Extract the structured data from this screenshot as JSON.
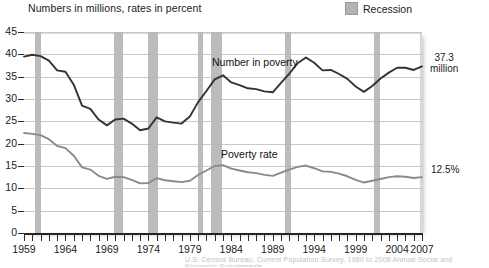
{
  "header": {
    "note": "Numbers in millions, rates in percent"
  },
  "legend": {
    "position": "top-right",
    "entries": [
      {
        "label": "Recession",
        "color": "#b6b6b6",
        "icon": "square-swatch"
      }
    ]
  },
  "annotations": {
    "number_label": "Number in poverty",
    "rate_label": "Poverty rate",
    "right_value_number_line1": "37.3",
    "right_value_number_line2": "million",
    "right_value_rate": "12.5%"
  },
  "footer": {
    "source_smudge": "U.S. Census Bureau, Current Population Survey, 1960 to 2008 Annual Social and Economic Supplements."
  },
  "chart_data": {
    "type": "line",
    "title": "",
    "subtitle": "Numbers in millions, rates in percent",
    "xlabel": "",
    "ylabel": "",
    "xlim": [
      1959,
      2007
    ],
    "ylim": [
      0,
      45
    ],
    "ytick_step": 5,
    "yticks": [
      0,
      5,
      10,
      15,
      20,
      25,
      30,
      35,
      40,
      45
    ],
    "xticks_labeled": [
      1959,
      1964,
      1969,
      1974,
      1979,
      1984,
      1989,
      1994,
      1999,
      2004,
      2007
    ],
    "xtick_step_minor": 1,
    "grid": true,
    "grid_axis": "y",
    "legend_position": "top-right",
    "x": [
      1959,
      1960,
      1961,
      1962,
      1963,
      1964,
      1965,
      1966,
      1967,
      1968,
      1969,
      1970,
      1971,
      1972,
      1973,
      1974,
      1975,
      1976,
      1977,
      1978,
      1979,
      1980,
      1981,
      1982,
      1983,
      1984,
      1985,
      1986,
      1987,
      1988,
      1989,
      1990,
      1991,
      1992,
      1993,
      1994,
      1995,
      1996,
      1997,
      1998,
      1999,
      2000,
      2001,
      2002,
      2003,
      2004,
      2005,
      2006,
      2007
    ],
    "series": [
      {
        "name": "Number in poverty",
        "units": "millions",
        "color": "#333333",
        "end_label": "37.3 million",
        "values": [
          39.5,
          39.9,
          39.6,
          38.6,
          36.4,
          36.1,
          33.2,
          28.5,
          27.8,
          25.4,
          24.1,
          25.4,
          25.6,
          24.5,
          23.0,
          23.4,
          25.9,
          25.0,
          24.7,
          24.5,
          26.1,
          29.3,
          31.8,
          34.4,
          35.3,
          33.7,
          33.1,
          32.4,
          32.2,
          31.7,
          31.5,
          33.6,
          35.7,
          38.0,
          39.3,
          38.1,
          36.4,
          36.5,
          35.6,
          34.5,
          32.8,
          31.6,
          32.9,
          34.6,
          35.9,
          37.0,
          37.0,
          36.5,
          37.3
        ]
      },
      {
        "name": "Poverty rate",
        "units": "percent",
        "color": "#8a8a8a",
        "end_label": "12.5%",
        "values": [
          22.4,
          22.2,
          21.9,
          21.0,
          19.5,
          19.0,
          17.3,
          14.7,
          14.2,
          12.8,
          12.1,
          12.6,
          12.5,
          11.9,
          11.1,
          11.2,
          12.3,
          11.8,
          11.6,
          11.4,
          11.7,
          13.0,
          14.0,
          15.0,
          15.2,
          14.4,
          14.0,
          13.6,
          13.4,
          13.0,
          12.8,
          13.5,
          14.2,
          14.8,
          15.1,
          14.5,
          13.8,
          13.7,
          13.3,
          12.7,
          11.9,
          11.3,
          11.7,
          12.1,
          12.5,
          12.7,
          12.6,
          12.3,
          12.5
        ]
      }
    ],
    "recession_bands": [
      {
        "start": 1960.3,
        "end": 1961.1
      },
      {
        "start": 1969.9,
        "end": 1970.9
      },
      {
        "start": 1973.9,
        "end": 1975.2
      },
      {
        "start": 1980.0,
        "end": 1980.6
      },
      {
        "start": 1981.5,
        "end": 1982.9
      },
      {
        "start": 1990.5,
        "end": 1991.2
      },
      {
        "start": 2001.2,
        "end": 2001.9
      }
    ]
  }
}
